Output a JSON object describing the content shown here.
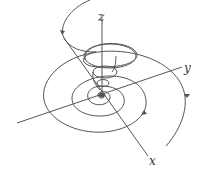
{
  "diagram": {
    "type": "3d-phase-portrait",
    "axes": {
      "x": {
        "label": "x"
      },
      "y": {
        "label": "y"
      },
      "z": {
        "label": "z"
      }
    },
    "colors": {
      "stroke": "#555555",
      "background": "#ffffff"
    }
  }
}
